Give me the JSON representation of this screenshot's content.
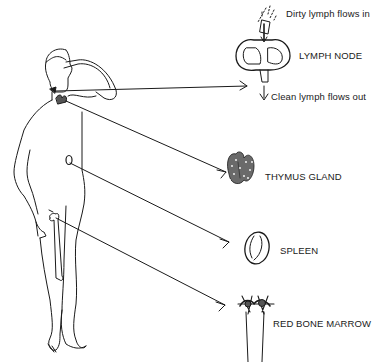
{
  "diagram": {
    "labels": {
      "dirty_in": "Dirty lymph flows in",
      "lymph_node": "LYMPH NODE",
      "clean_out": "Clean lymph flows out",
      "thymus": "THYMUS GLAND",
      "spleen": "SPLEEN",
      "marrow": "RED BONE MARROW"
    },
    "organs": [
      {
        "name": "lymph node",
        "icon": "lymph-node-icon"
      },
      {
        "name": "thymus gland",
        "icon": "thymus-icon"
      },
      {
        "name": "spleen",
        "icon": "spleen-icon"
      },
      {
        "name": "red bone marrow",
        "icon": "bone-marrow-icon"
      }
    ],
    "colors": {
      "ink": "#1a1a1a",
      "background": "#ffffff"
    }
  }
}
